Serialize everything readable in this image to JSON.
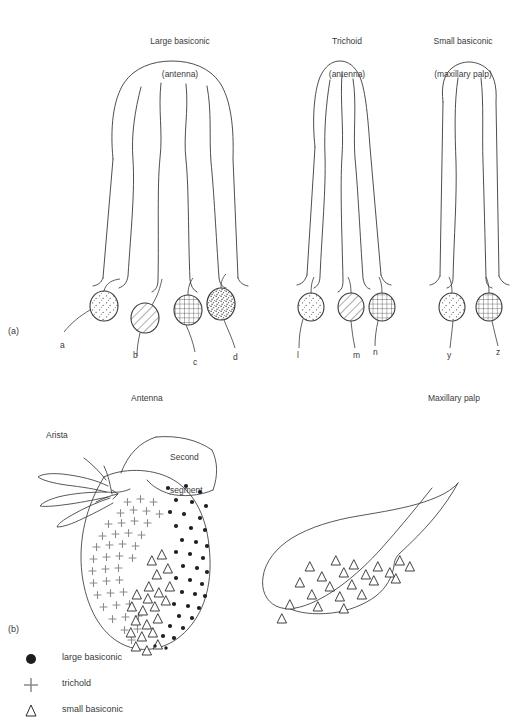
{
  "figure": {
    "panel_a": {
      "label": "(a)",
      "columns": [
        {
          "title_line1": "Large basiconic",
          "title_line2": "(antenna)"
        },
        {
          "title_line1": "Trichoid",
          "title_line2": "(antenna)"
        },
        {
          "title_line1": "Small basiconic",
          "title_line2": "(maxillary palp)"
        }
      ],
      "cross_sections": [
        {
          "id": "a",
          "label": "a",
          "pattern": "fine-stipple"
        },
        {
          "id": "b",
          "label": "b",
          "pattern": "diagonal-hatch"
        },
        {
          "id": "c",
          "label": "c",
          "pattern": "cross-hatch"
        },
        {
          "id": "d",
          "label": "d",
          "pattern": "dense-stipple"
        },
        {
          "id": "l",
          "label": "l",
          "pattern": "fine-stipple"
        },
        {
          "id": "m",
          "label": "m",
          "pattern": "diagonal-hatch"
        },
        {
          "id": "n",
          "label": "n",
          "pattern": "cross-hatch"
        },
        {
          "id": "y",
          "label": "y",
          "pattern": "fine-stipple"
        },
        {
          "id": "z",
          "label": "z",
          "pattern": "cross-hatch"
        }
      ]
    },
    "panel_b": {
      "label": "(b)",
      "antenna": {
        "title": "Antenna",
        "arista_label": "Arista",
        "second_segment_label_line1": "Second",
        "second_segment_label_line2": "segment"
      },
      "maxillary_palp": {
        "title": "Maxillary palp"
      }
    },
    "legend": [
      {
        "symbol": "filled-circle",
        "label": "large basiconic"
      },
      {
        "symbol": "plus",
        "label": "trichold"
      },
      {
        "symbol": "open-triangle",
        "label": "small basiconic"
      }
    ]
  },
  "colors": {
    "stroke": "#3a3a3a",
    "text": "#3a3a3a",
    "background": "#ffffff"
  }
}
